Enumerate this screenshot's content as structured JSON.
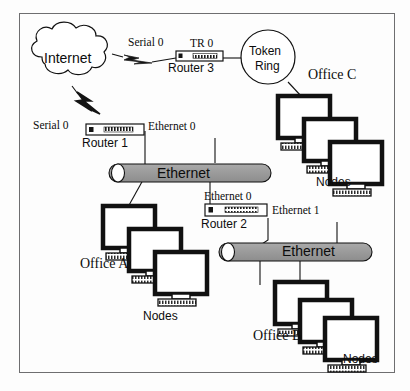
{
  "diagram": {
    "type": "network-topology",
    "frame": {
      "border_color": "#6e6e70",
      "background": "#fdfdfd"
    },
    "colors": {
      "line": "#111111",
      "bus_fill": "#9c9c9c",
      "bus_stroke": "#111111",
      "monitor_bezel": "#111111",
      "screen": "#ffffff",
      "text": "#0c0c0c"
    },
    "clouds": [
      {
        "name": "internet-cloud",
        "label": "Internet"
      }
    ],
    "rings": [
      {
        "name": "token-ring",
        "label_line1": "Token",
        "label_line2": "Ring"
      }
    ],
    "routers": [
      {
        "name": "router-1",
        "label": "Router 1"
      },
      {
        "name": "router-2",
        "label": "Router 2"
      },
      {
        "name": "router-3",
        "label": "Router 3"
      }
    ],
    "buses": [
      {
        "name": "ethernet-bus-a",
        "label": "Ethernet"
      },
      {
        "name": "ethernet-bus-b",
        "label": "Ethernet"
      }
    ],
    "interface_labels": [
      {
        "name": "serial-0-router3",
        "label": "Serial 0"
      },
      {
        "name": "tr-0-router3",
        "label": "TR 0"
      },
      {
        "name": "serial-0-router1",
        "label": "Serial 0"
      },
      {
        "name": "ethernet-0-router1",
        "label": "Ethernet 0"
      },
      {
        "name": "ethernet-0-router2",
        "label": "Ethernet 0"
      },
      {
        "name": "ethernet-1-router2",
        "label": "Ethernet 1"
      }
    ],
    "offices": [
      {
        "name": "office-a",
        "label": "Office A",
        "nodes_label": "Nodes",
        "node_count": 3
      },
      {
        "name": "office-b",
        "label": "Office B",
        "nodes_label": "Nodes",
        "node_count": 3
      },
      {
        "name": "office-c",
        "label": "Office C",
        "nodes_label": "Nodes",
        "node_count": 3
      }
    ],
    "links": [
      {
        "from": "internet-cloud",
        "to": "router-3",
        "media": "serial-lightning"
      },
      {
        "from": "internet-cloud",
        "to": "router-1",
        "media": "serial-lightning"
      },
      {
        "from": "router-3",
        "to": "token-ring",
        "media": "line"
      },
      {
        "from": "token-ring",
        "to": "office-c",
        "media": "line"
      },
      {
        "from": "router-1",
        "to": "ethernet-bus-a",
        "media": "line"
      },
      {
        "from": "ethernet-bus-a",
        "to": "office-a",
        "media": "line"
      },
      {
        "from": "ethernet-bus-a",
        "to": "router-2",
        "media": "line"
      },
      {
        "from": "router-2",
        "to": "ethernet-bus-b",
        "media": "line"
      },
      {
        "from": "ethernet-bus-b",
        "to": "office-b",
        "media": "line"
      }
    ]
  }
}
